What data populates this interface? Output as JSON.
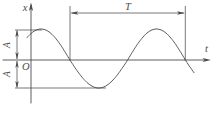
{
  "figure": {
    "type": "sinusoidal-oscillation-diagram",
    "labels": {
      "vertical_axis": "x",
      "horizontal_axis": "t",
      "origin": "O",
      "period": "T",
      "amplitude_upper": "A",
      "amplitude_lower": "A"
    },
    "colors": {
      "stroke": "#4c4c4c",
      "background": "#ffffff"
    },
    "curve": {
      "shape": "sine",
      "x_start": 27,
      "x_end": 194,
      "first_peak_x": 41,
      "period_px": 115.5,
      "axis_y": 60,
      "amp_above_px": 31,
      "amp_below_px": 28
    }
  }
}
